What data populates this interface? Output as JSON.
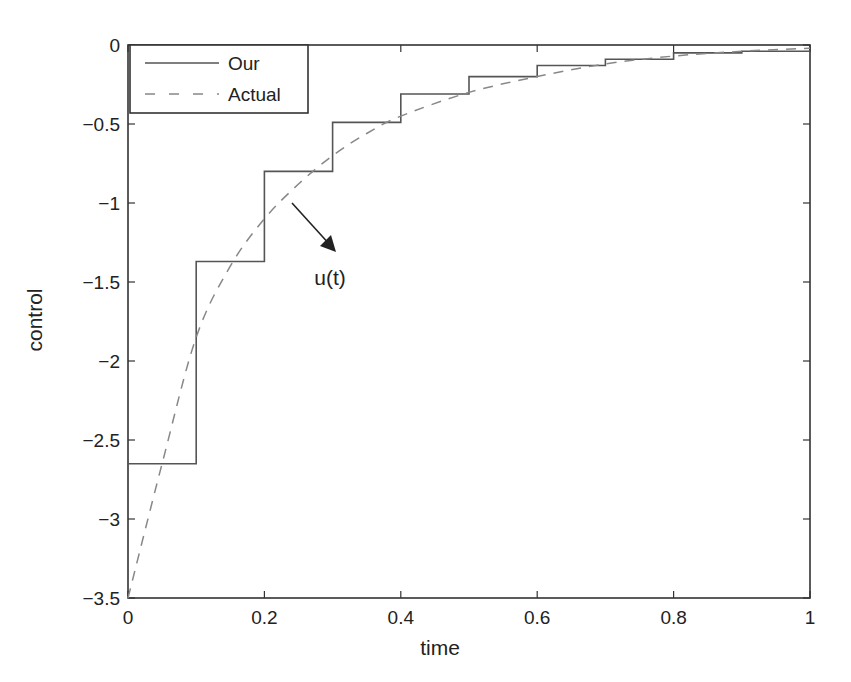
{
  "chart_data": {
    "type": "line",
    "title": "",
    "xlabel": "time",
    "ylabel": "control",
    "xlim": [
      0,
      1
    ],
    "ylim": [
      -3.5,
      0
    ],
    "xticks": [
      0,
      0.2,
      0.4,
      0.6,
      0.8,
      1
    ],
    "xtick_labels": [
      "0",
      "0.2",
      "0.4",
      "0.6",
      "0.8",
      "1"
    ],
    "yticks": [
      0,
      -0.5,
      -1,
      -1.5,
      -2,
      -2.5,
      -3,
      -3.5
    ],
    "ytick_labels": [
      "0",
      "-0.5",
      "-1",
      "-1.5",
      "-2",
      "-2.5",
      "-3",
      "-3.5"
    ],
    "grid": false,
    "legend_position": "upper left",
    "series": [
      {
        "name": "Our",
        "style": "solid-step",
        "x": [
          0,
          0.1,
          0.2,
          0.3,
          0.4,
          0.5,
          0.6,
          0.7,
          0.8,
          0.9,
          1.0
        ],
        "values": [
          -2.65,
          -1.37,
          -0.8,
          -0.49,
          -0.31,
          -0.2,
          -0.13,
          -0.09,
          -0.05,
          -0.04,
          -0.04
        ]
      },
      {
        "name": "Actual",
        "style": "dashed",
        "x": [
          0,
          0.05,
          0.1,
          0.15,
          0.2,
          0.25,
          0.3,
          0.35,
          0.4,
          0.5,
          0.6,
          0.7,
          0.8,
          0.9,
          1.0
        ],
        "values": [
          -3.5,
          -2.65,
          -1.85,
          -1.4,
          -1.1,
          -0.88,
          -0.7,
          -0.56,
          -0.45,
          -0.3,
          -0.2,
          -0.12,
          -0.07,
          -0.04,
          -0.02
        ]
      }
    ],
    "annotations": [
      {
        "text": "u(t)",
        "arrow_from": [
          0.24,
          -0.96
        ],
        "arrow_to": [
          0.31,
          -1.3
        ]
      }
    ]
  },
  "colors": {
    "axis": "#333333",
    "our_line": "#555555",
    "actual_line": "#888888",
    "text": "#222222"
  }
}
